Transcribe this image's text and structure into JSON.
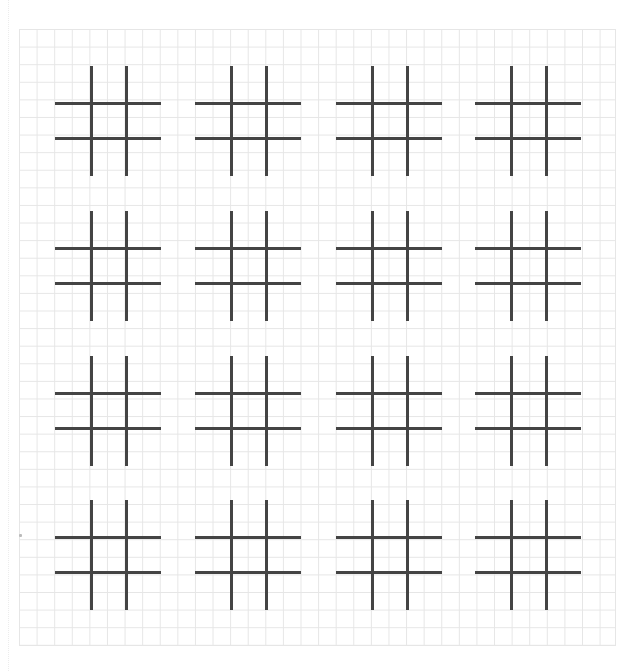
{
  "worksheet": {
    "type": "tic-tac-toe practice sheet",
    "background": "graph paper",
    "grid": {
      "color": "#e6e6e6",
      "cell_size_px": 17.6,
      "columns": 34,
      "rows": 35
    },
    "boards": {
      "rows": 4,
      "columns": 4,
      "count": 16,
      "line_color": "#444444",
      "state": "all empty",
      "positions": [
        {
          "row": 1,
          "col": 1,
          "left": 55,
          "top": 66
        },
        {
          "row": 1,
          "col": 2,
          "left": 195,
          "top": 66
        },
        {
          "row": 1,
          "col": 3,
          "left": 336,
          "top": 66
        },
        {
          "row": 1,
          "col": 4,
          "left": 475,
          "top": 66
        },
        {
          "row": 2,
          "col": 1,
          "left": 55,
          "top": 211
        },
        {
          "row": 2,
          "col": 2,
          "left": 195,
          "top": 211
        },
        {
          "row": 2,
          "col": 3,
          "left": 336,
          "top": 211
        },
        {
          "row": 2,
          "col": 4,
          "left": 475,
          "top": 211
        },
        {
          "row": 3,
          "col": 1,
          "left": 55,
          "top": 356
        },
        {
          "row": 3,
          "col": 2,
          "left": 195,
          "top": 356
        },
        {
          "row": 3,
          "col": 3,
          "left": 336,
          "top": 356
        },
        {
          "row": 3,
          "col": 4,
          "left": 475,
          "top": 356
        },
        {
          "row": 4,
          "col": 1,
          "left": 55,
          "top": 500
        },
        {
          "row": 4,
          "col": 2,
          "left": 195,
          "top": 500
        },
        {
          "row": 4,
          "col": 3,
          "left": 336,
          "top": 500
        },
        {
          "row": 4,
          "col": 4,
          "left": 475,
          "top": 500
        }
      ]
    }
  }
}
